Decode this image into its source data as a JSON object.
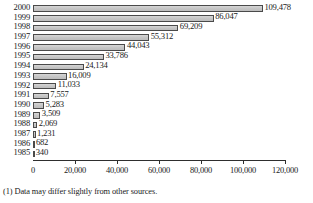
{
  "chart_data": {
    "type": "bar",
    "orientation": "horizontal",
    "title": "",
    "xlabel": "",
    "ylabel": "",
    "categories": [
      "2000",
      "1999",
      "1998",
      "1997",
      "1996",
      "1995",
      "1994",
      "1993",
      "1992",
      "1991",
      "1990",
      "1989",
      "1988",
      "1987",
      "1986",
      "1985"
    ],
    "values": [
      109478,
      86047,
      69209,
      55312,
      44043,
      33786,
      24134,
      16009,
      11033,
      7557,
      5283,
      3509,
      2069,
      1231,
      682,
      340
    ],
    "value_labels": [
      "109,478",
      "86,047",
      "69,209",
      "55,312",
      "44,043",
      "33,786",
      "24,134",
      "16,009",
      "11,033",
      "7,557",
      "5,283",
      "3,509",
      "2,069",
      "1,231",
      "682",
      "340"
    ],
    "xlim": [
      0,
      120000
    ],
    "xticks": [
      0,
      20000,
      40000,
      60000,
      80000,
      100000,
      120000
    ],
    "xtick_labels": [
      "0",
      "20,000",
      "40,000",
      "60,000",
      "80,000",
      "100,000",
      "120,000"
    ],
    "grid": false,
    "legend": false,
    "bar_color": "#c9c9c9",
    "bar_border_color": "#4a4a4a",
    "axis_color": "#2e2e2e"
  },
  "footnote": "(1) Data may differ slightly from other sources."
}
